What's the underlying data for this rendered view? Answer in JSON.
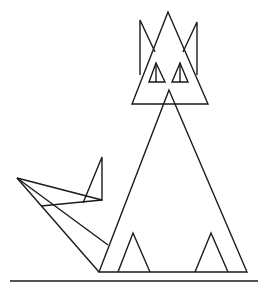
{
  "figure": {
    "stroke_color": "#1a1a1a",
    "background": "#ffffff",
    "shapes": {
      "head": [
        [
          168,
          12
        ],
        [
          132,
          104
        ],
        [
          208,
          104
        ]
      ],
      "ear_left": [
        [
          140,
          75
        ],
        [
          140,
          20
        ],
        [
          155,
          52
        ]
      ],
      "ear_right": [
        [
          197,
          75
        ],
        [
          197,
          22
        ],
        [
          183,
          52
        ]
      ],
      "eye_left": [
        [
          156,
          63
        ],
        [
          149,
          82
        ],
        [
          165,
          82
        ]
      ],
      "eye_left_pupil": [
        [
          156,
          63
        ],
        [
          156,
          82
        ]
      ],
      "eye_right": [
        [
          180,
          63
        ],
        [
          172,
          82
        ],
        [
          188,
          82
        ]
      ],
      "eye_right_pupil": [
        [
          180,
          63
        ],
        [
          180,
          82
        ]
      ],
      "body": [
        [
          169,
          90
        ],
        [
          99,
          272
        ],
        [
          247,
          272
        ]
      ],
      "foot_left": [
        [
          118,
          272
        ],
        [
          133,
          233
        ],
        [
          150,
          272
        ]
      ],
      "foot_right": [
        [
          195,
          272
        ],
        [
          211,
          233
        ],
        [
          228,
          272
        ]
      ],
      "tail_upper": [
        [
          17,
          178
        ],
        [
          102,
          200
        ],
        [
          102,
          157
        ],
        [
          83,
          203
        ]
      ],
      "tail_cross": [
        [
          41,
          206
        ],
        [
          102,
          200
        ]
      ],
      "tail_middle": [
        [
          17,
          178
        ],
        [
          108,
          245
        ]
      ],
      "tail_lower": [
        [
          17,
          178
        ],
        [
          99,
          272
        ]
      ],
      "ground": [
        [
          10,
          281
        ],
        [
          258,
          281
        ]
      ]
    }
  }
}
